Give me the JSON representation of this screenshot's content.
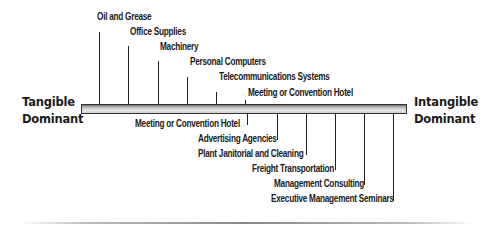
{
  "diagram": {
    "left_end": {
      "line1": "Tangible",
      "line2": "Dominant"
    },
    "right_end": {
      "line1": "Intangible",
      "line2": "Dominant"
    },
    "upper_items": [
      {
        "label": "Oil and Grease"
      },
      {
        "label": "Office Supplies"
      },
      {
        "label": "Machinery"
      },
      {
        "label": "Personal Computers"
      },
      {
        "label": "Telecommunications Systems"
      },
      {
        "label": "Meeting or Convention Hotel"
      }
    ],
    "lower_items": [
      {
        "label": "Meeting or Convention Hotel"
      },
      {
        "label": "Advertising Agencies"
      },
      {
        "label": "Plant Janitorial and Cleaning"
      },
      {
        "label": "Freight Transportation"
      },
      {
        "label": "Management Consulting"
      },
      {
        "label": "Executive Management Seminars"
      }
    ],
    "colors": {
      "bar_dark": "#6e6e6e",
      "bar_light": "#e6e6e6",
      "text": "#1a1a1a"
    }
  }
}
